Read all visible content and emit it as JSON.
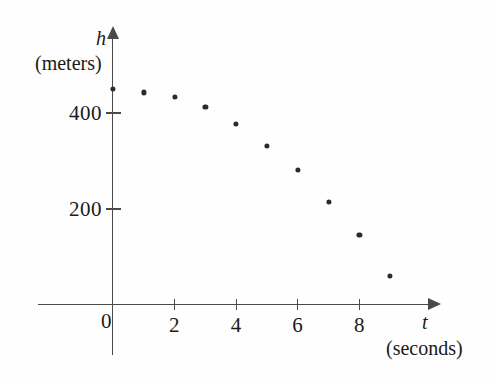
{
  "figure": {
    "background_color": "#fefefe",
    "axis_color": "#4a4a4a",
    "point_color": "#2b2b2b"
  },
  "axes": {
    "y_name": "h",
    "y_unit": "(meters)",
    "x_name": "t",
    "x_unit": "(seconds)",
    "origin_label": "0"
  },
  "chart_data": {
    "type": "scatter",
    "title": "",
    "xlabel": "t",
    "ylabel": "h",
    "x_unit": "seconds",
    "y_unit": "meters",
    "x": [
      0,
      1,
      2,
      3,
      4,
      5,
      6,
      7,
      8,
      9
    ],
    "values": [
      450,
      443,
      433,
      412,
      377,
      331,
      281,
      215,
      146,
      60
    ],
    "series": [
      {
        "name": "height",
        "points": [
          {
            "t": 0,
            "h": 450
          },
          {
            "t": 1,
            "h": 443
          },
          {
            "t": 2,
            "h": 433
          },
          {
            "t": 3,
            "h": 412
          },
          {
            "t": 4,
            "h": 377
          },
          {
            "t": 5,
            "h": 331
          },
          {
            "t": 6,
            "h": 281
          },
          {
            "t": 7,
            "h": 215
          },
          {
            "t": 8,
            "h": 146
          },
          {
            "t": 9,
            "h": 60
          }
        ]
      }
    ],
    "xlim": [
      0,
      10.2
    ],
    "ylim": [
      0,
      560
    ],
    "x_ticks": [
      {
        "value": 2,
        "label": "2"
      },
      {
        "value": 4,
        "label": "4"
      },
      {
        "value": 6,
        "label": "6"
      },
      {
        "value": 8,
        "label": "8"
      }
    ],
    "y_ticks": [
      {
        "value": 200,
        "label": "200"
      },
      {
        "value": 400,
        "label": "400"
      }
    ],
    "grid": false,
    "legend": null
  }
}
